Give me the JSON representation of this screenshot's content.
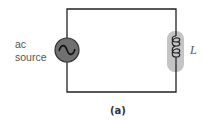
{
  "diagram": {
    "type": "circuit",
    "source": {
      "label_line1": "ac",
      "label_line2": "source",
      "symbol": "ac-sine"
    },
    "inductor": {
      "label": "L",
      "loops": 4
    },
    "caption": "(a)",
    "colors": {
      "wire": "#222222",
      "source_fill": "#707070",
      "inductor_highlight": "#c4c4c4",
      "label": "#555555"
    }
  }
}
